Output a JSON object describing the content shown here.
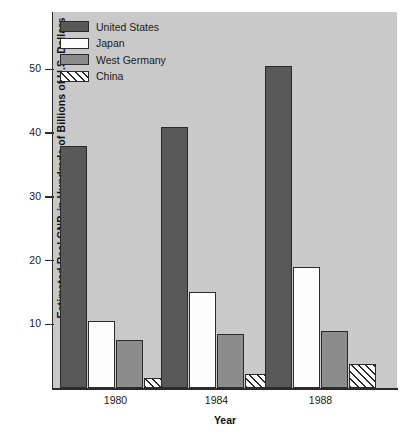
{
  "chart_data": {
    "type": "bar",
    "title": "",
    "xlabel": "Year",
    "ylabel": "Estimated Real GNP, in Hundreds of Billions of U.S. Dollars",
    "categories": [
      "1980",
      "1984",
      "1988"
    ],
    "yticks": [
      10,
      20,
      30,
      40,
      50
    ],
    "ylim": [
      0,
      58
    ],
    "grid": false,
    "legend_position": "top-left",
    "series": [
      {
        "name": "United States",
        "color": "#595959",
        "fill": "solid",
        "values": [
          38,
          41,
          50.5
        ]
      },
      {
        "name": "Japan",
        "color": "#fdfdfd",
        "fill": "solid",
        "values": [
          10.5,
          15,
          19
        ]
      },
      {
        "name": "West Germany",
        "color": "#8c8c8c",
        "fill": "solid",
        "values": [
          7.5,
          8.5,
          9
        ]
      },
      {
        "name": "China",
        "color": "#fdfdfd",
        "fill": "hatched",
        "values": [
          1.5,
          2.2,
          3.8
        ]
      }
    ]
  },
  "axes": {
    "y_title": "Estimated Real GNP, in Hundreds of Billions of U.S. Dollars",
    "x_title": "Year",
    "y_tick_labels": [
      "50",
      "40",
      "30",
      "20",
      "10"
    ],
    "x_tick_labels": [
      "1980",
      "1984",
      "1988"
    ]
  },
  "legend": {
    "items": [
      {
        "label": "United States"
      },
      {
        "label": "Japan"
      },
      {
        "label": "West Germany"
      },
      {
        "label": "China"
      }
    ]
  },
  "plot": {
    "background_color": "#c9c9c9",
    "axis_color": "#2b2b2b"
  }
}
